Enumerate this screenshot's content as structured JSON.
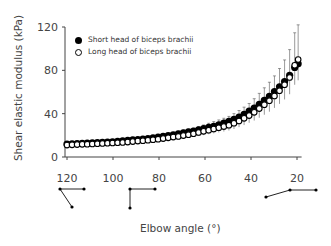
{
  "chart_data": {
    "type": "line",
    "title": "",
    "xlabel": "Elbow angle (°)",
    "ylabel": "Shear elastic modulus (kPa)",
    "xlim": [
      120,
      18
    ],
    "ylim": [
      0,
      120
    ],
    "x_reversed": true,
    "x_ticks": [
      120,
      100,
      80,
      60,
      40,
      20
    ],
    "y_ticks": [
      0,
      40,
      80,
      120
    ],
    "grid": false,
    "legend_position": "upper-left",
    "x": [
      120,
      115,
      110,
      105,
      100,
      95,
      90,
      85,
      80,
      75,
      70,
      65,
      60,
      55,
      50,
      47,
      44,
      41,
      38,
      35,
      32,
      29,
      26,
      23,
      20
    ],
    "series": [
      {
        "name": "Short head of biceps brachii",
        "marker": "filled-circle",
        "values": [
          12,
          12.5,
          13,
          13.5,
          14,
          15,
          16,
          17,
          18.5,
          20,
          22,
          24,
          26.5,
          29,
          32.5,
          35,
          38,
          42,
          46,
          51,
          56,
          62,
          68,
          76,
          86
        ],
        "error": [
          2,
          2,
          2,
          2,
          2,
          2,
          2,
          2,
          2,
          2,
          2,
          2,
          2,
          2,
          2,
          2,
          2,
          2,
          2,
          2,
          2,
          2,
          2,
          2,
          2
        ]
      },
      {
        "name": "Long head of biceps brachii",
        "marker": "open-circle",
        "values": [
          11,
          11.5,
          12,
          12.5,
          13,
          13.5,
          14.5,
          15.5,
          16.5,
          18,
          19.5,
          21.5,
          24,
          26.5,
          29,
          31.5,
          34.5,
          38,
          42,
          47,
          52,
          58,
          65,
          74,
          90
        ],
        "error": [
          3,
          3,
          3,
          3,
          3,
          3,
          3,
          3,
          4,
          4,
          5,
          5,
          6,
          7,
          8,
          9,
          10,
          11,
          13,
          15,
          17,
          19,
          22,
          26,
          32
        ]
      }
    ],
    "annotations": [
      "arm posture icon at 120°",
      "arm posture icon at 90°",
      "arm posture icon at 20°"
    ]
  },
  "legend": {
    "items": [
      {
        "label": "Short head of biceps brachii"
      },
      {
        "label": "Long head of biceps brachii"
      }
    ]
  }
}
